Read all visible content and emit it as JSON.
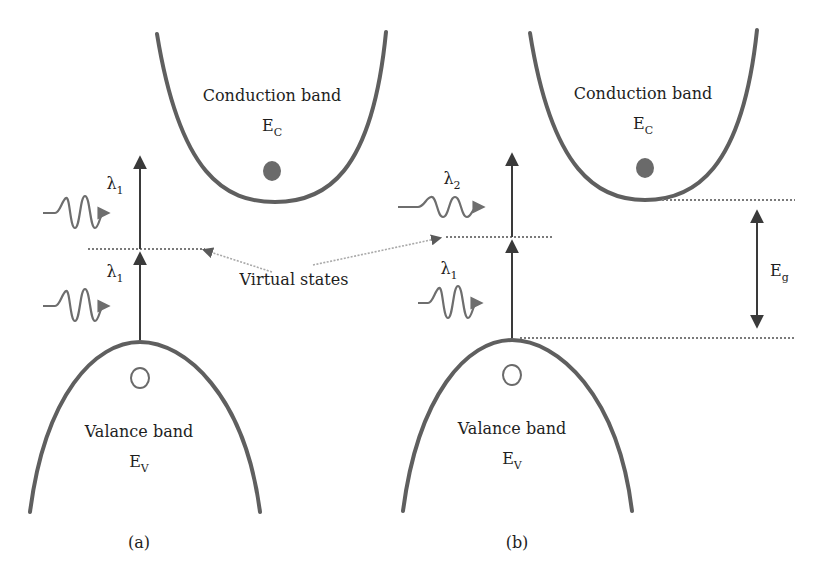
{
  "colors": {
    "band": "#5f5f5f",
    "arrow": "#3a3a3a",
    "wave": "#6e6e6e",
    "dotted": "#7a7a7a",
    "pointer": "#a9a9a9",
    "electron": "#6a6a6a",
    "text": "#1e1e1e"
  },
  "panel_a": {
    "conduction": {
      "title": "Conduction band",
      "symbol": "E",
      "subscript": "C"
    },
    "valence": {
      "title": "Valance band",
      "symbol": "E",
      "subscript": "V"
    },
    "photon_upper": {
      "symbol": "λ",
      "subscript": "1"
    },
    "photon_lower": {
      "symbol": "λ",
      "subscript": "1"
    },
    "caption": "(a)"
  },
  "panel_b": {
    "conduction": {
      "title": "Conduction band",
      "symbol": "E",
      "subscript": "C"
    },
    "valence": {
      "title": "Valance band",
      "symbol": "E",
      "subscript": "V"
    },
    "photon_upper": {
      "symbol": "λ",
      "subscript": "2"
    },
    "photon_lower": {
      "symbol": "λ",
      "subscript": "1"
    },
    "bandgap": {
      "symbol": "E",
      "subscript": "g"
    },
    "caption": "(b)"
  },
  "shared": {
    "virtual_states_label": "Virtual states"
  }
}
